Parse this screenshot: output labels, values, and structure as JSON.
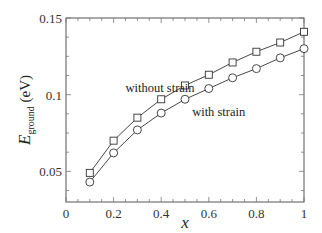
{
  "chart_data": {
    "type": "line",
    "title": "",
    "xlabel": "x",
    "ylabel": "E_ground (eV)",
    "ylabel_main": "E",
    "ylabel_sub": "ground",
    "ylabel_unit": " (eV)",
    "xlim": [
      0,
      1
    ],
    "ylim": [
      0.03,
      0.15
    ],
    "grid": false,
    "legend_position": "inline annotations",
    "x_ticks": [
      "0",
      "0.2",
      "0.4",
      "0.6",
      "0.8",
      "1"
    ],
    "y_ticks": [
      "0.05",
      "0.1",
      "0.15"
    ],
    "x": [
      0.1,
      0.2,
      0.3,
      0.4,
      0.5,
      0.6,
      0.7,
      0.8,
      0.9,
      1.0
    ],
    "series": [
      {
        "name": "without strain",
        "marker": "square",
        "values": [
          0.049,
          0.07,
          0.085,
          0.097,
          0.106,
          0.113,
          0.121,
          0.128,
          0.134,
          0.141
        ]
      },
      {
        "name": "with strain",
        "marker": "circle",
        "values": [
          0.043,
          0.062,
          0.077,
          0.088,
          0.097,
          0.104,
          0.111,
          0.117,
          0.124,
          0.13
        ]
      }
    ],
    "annotations": [
      {
        "text": "without strain",
        "x": 0.25,
        "y": 0.102
      },
      {
        "text": "with strain",
        "x": 0.53,
        "y": 0.086
      }
    ]
  },
  "colors": {
    "line": "#333333",
    "frame": "#555555"
  }
}
